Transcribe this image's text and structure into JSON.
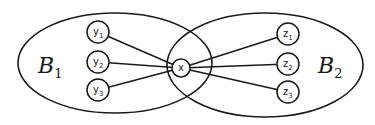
{
  "diagram": {
    "type": "bipartite-sets-venn",
    "sets": [
      {
        "id": "B1",
        "label": "B",
        "subscript": "1",
        "cx": 115,
        "cy": 63,
        "rx": 97,
        "ry": 50,
        "label_x": 38,
        "label_y": 73
      },
      {
        "id": "B2",
        "label": "B",
        "subscript": "2",
        "cx": 265,
        "cy": 65,
        "rx": 98,
        "ry": 52,
        "label_x": 318,
        "label_y": 73
      }
    ],
    "center_node": {
      "id": "x",
      "label": "x",
      "cx": 181,
      "cy": 68,
      "r": 9
    },
    "nodes": [
      {
        "id": "y1",
        "label": "y",
        "subscript": "1",
        "cx": 98,
        "cy": 32,
        "r": 11,
        "set": "B1"
      },
      {
        "id": "y2",
        "label": "y",
        "subscript": "2",
        "cx": 98,
        "cy": 62,
        "r": 11,
        "set": "B1"
      },
      {
        "id": "y3",
        "label": "y",
        "subscript": "3",
        "cx": 98,
        "cy": 90,
        "r": 11,
        "set": "B1"
      },
      {
        "id": "z1",
        "label": "z",
        "subscript": "1",
        "cx": 288,
        "cy": 34,
        "r": 11,
        "set": "B2"
      },
      {
        "id": "z2",
        "label": "z",
        "subscript": "2",
        "cx": 288,
        "cy": 64,
        "r": 11,
        "set": "B2"
      },
      {
        "id": "z3",
        "label": "z",
        "subscript": "3",
        "cx": 288,
        "cy": 92,
        "r": 11,
        "set": "B2"
      }
    ],
    "edges": [
      {
        "from": "y1",
        "to": "x"
      },
      {
        "from": "y2",
        "to": "x"
      },
      {
        "from": "y3",
        "to": "x"
      },
      {
        "from": "x",
        "to": "z1"
      },
      {
        "from": "x",
        "to": "z2"
      },
      {
        "from": "x",
        "to": "z3"
      }
    ],
    "colors": {
      "stroke": "#1a1a1a",
      "background": "#ffffff"
    }
  }
}
